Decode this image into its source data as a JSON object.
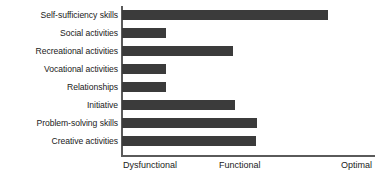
{
  "chart_data": {
    "type": "bar",
    "orientation": "horizontal",
    "title": "",
    "subtitle": "",
    "xlabel": "",
    "ylabel": "",
    "grid": false,
    "legend": false,
    "categories": [
      "Self-sufficiency skills",
      "Social activities",
      "Recreational activities",
      "Vocational activities",
      "Relationships",
      "Initiative",
      "Problem-solving skills",
      "Creative activities"
    ],
    "values": [
      1.63,
      0.35,
      0.88,
      0.35,
      0.35,
      0.89,
      1.07,
      1.06
    ],
    "xlim": [
      0,
      2
    ],
    "xtick_values": [
      0,
      1,
      2
    ],
    "xtick_labels": [
      "Dysfunctional",
      "Functional",
      "Optimal"
    ],
    "bar_color": "#3b3b3b",
    "axis_color": "#5a5a5a",
    "background_color": "#ffffff"
  },
  "axis": {
    "tick_start": "Dysfunctional",
    "tick_mid": "Functional",
    "tick_end": "Optimal"
  },
  "categories": {
    "c0": "Self-sufficiency skills",
    "c1": "Social activities",
    "c2": "Recreational activities",
    "c3": "Vocational activities",
    "c4": "Relationships",
    "c5": "Initiative",
    "c6": "Problem-solving skills",
    "c7": "Creative activities"
  }
}
